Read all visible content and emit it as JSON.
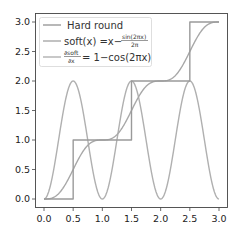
{
  "chart_data": {
    "type": "line",
    "title": "",
    "xlabel": "",
    "ylabel": "",
    "xlim": [
      -0.15,
      3.15
    ],
    "ylim": [
      -0.15,
      3.15
    ],
    "grid": false,
    "legend_position": "upper left",
    "xticks": [
      "0.0",
      "0.5",
      "1.0",
      "1.5",
      "2.0",
      "2.5",
      "3.0"
    ],
    "yticks": [
      "0.0",
      "0.5",
      "1.0",
      "1.5",
      "2.0",
      "2.5",
      "3.0"
    ],
    "series": [
      {
        "name": "Hard round",
        "color": "#9a9a9a",
        "kind": "step",
        "x": [
          0,
          0.5,
          0.5,
          1.5,
          1.5,
          2.5,
          2.5,
          3.0
        ],
        "y": [
          0,
          0,
          1,
          1,
          2,
          2,
          3,
          3
        ]
      },
      {
        "name": "soft(x) = x − sin(2πx)/2π",
        "color": "#a8a8a8",
        "kind": "function",
        "expr": "soft",
        "x_range": [
          0,
          3
        ]
      },
      {
        "name": "∂soft/∂x = 1 − cos(2πx)",
        "color": "#b0b0b0",
        "kind": "function",
        "expr": "dsoft",
        "x_range": [
          0,
          3
        ]
      }
    ]
  },
  "legend": {
    "items": [
      {
        "label": "Hard round"
      },
      {
        "label_main": "soft(x) =x−",
        "frac_num": "sin(2πx)",
        "frac_den": "2π"
      },
      {
        "frac_num": "∂soft",
        "frac_den": "∂x",
        "label_main": "= 1−cos(2πx)"
      }
    ]
  }
}
